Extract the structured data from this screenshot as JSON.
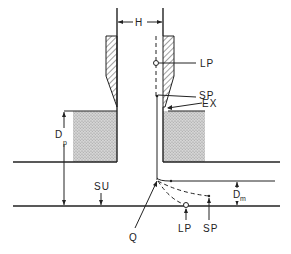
{
  "diagram": {
    "labels": {
      "H": "H",
      "LP_top": "LP",
      "SP_top": "SP",
      "EX": "EX",
      "Dp_main": "D",
      "Dp_sub": "p",
      "SU": "SU",
      "Dm_main": "D",
      "Dm_sub": "m",
      "Q": "Q",
      "LP_bottom": "LP",
      "SP_bottom": "SP"
    },
    "colors": {
      "line": "#222222",
      "stipple": "#bdbdbd",
      "background": "#ffffff"
    }
  }
}
